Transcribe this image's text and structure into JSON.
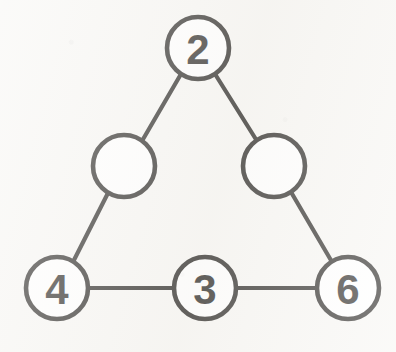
{
  "diagram": {
    "type": "graph",
    "canvas": {
      "width": 396,
      "height": 352
    },
    "colors": {
      "background": "#f7f6f3",
      "stroke": "#14120f",
      "node_fill": "#ffffff"
    },
    "node_radius": 31,
    "nodes": [
      {
        "id": "apex",
        "label": "2",
        "filled": true,
        "cx": 198,
        "cy": 48
      },
      {
        "id": "mid-left",
        "label": "",
        "filled": false,
        "cx": 124,
        "cy": 166
      },
      {
        "id": "mid-right",
        "label": "",
        "filled": false,
        "cx": 274,
        "cy": 166
      },
      {
        "id": "bottom-left",
        "label": "4",
        "filled": true,
        "cx": 57,
        "cy": 288
      },
      {
        "id": "bottom-mid",
        "label": "3",
        "filled": true,
        "cx": 205,
        "cy": 288
      },
      {
        "id": "bottom-right",
        "label": "6",
        "filled": true,
        "cx": 348,
        "cy": 288
      }
    ],
    "edges": [
      {
        "id": "edge-apex-midleft",
        "from": "apex",
        "to": "mid-left",
        "x1": 181,
        "y1": 74,
        "x2": 142,
        "y2": 141
      },
      {
        "id": "edge-apex-midright",
        "from": "apex",
        "to": "mid-right",
        "x1": 215,
        "y1": 74,
        "x2": 257,
        "y2": 141
      },
      {
        "id": "edge-midleft-bottomleft",
        "from": "mid-left",
        "to": "bottom-left",
        "x1": 108,
        "y1": 193,
        "x2": 73,
        "y2": 262
      },
      {
        "id": "edge-midright-bottomright",
        "from": "mid-right",
        "to": "bottom-right",
        "x1": 291,
        "y1": 192,
        "x2": 332,
        "y2": 262
      },
      {
        "id": "edge-bottomleft-bottommid",
        "from": "bottom-left",
        "to": "bottom-mid",
        "x1": 88,
        "y1": 288,
        "x2": 174,
        "y2": 288
      },
      {
        "id": "edge-bottommid-bottomright",
        "from": "bottom-mid",
        "to": "bottom-right",
        "x1": 236,
        "y1": 288,
        "x2": 317,
        "y2": 288
      }
    ]
  }
}
